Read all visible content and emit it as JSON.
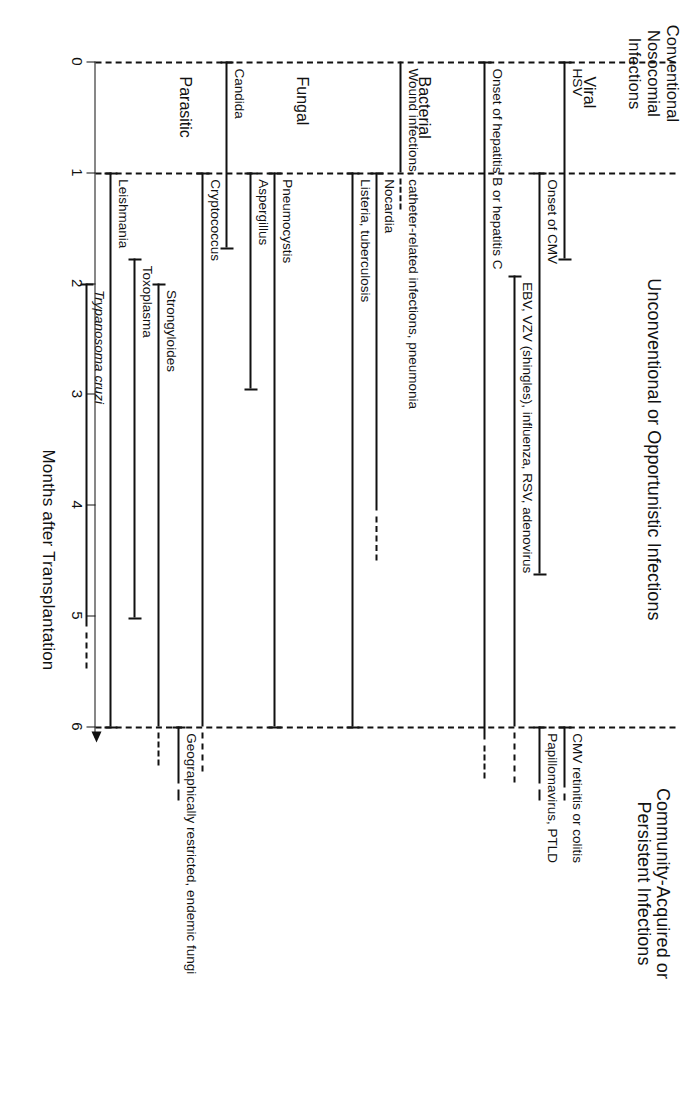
{
  "figure": {
    "axis_title": "Months after Transplantation",
    "x_ticks": [
      "0",
      "1",
      "2",
      "3",
      "4",
      "5",
      "6"
    ],
    "phases": [
      {
        "id": "conventional",
        "lines": [
          "Conventional",
          "Nosocomial",
          "Infections"
        ]
      },
      {
        "id": "unconventional",
        "lines": [
          "Unconventional or Opportunistic Infections"
        ]
      },
      {
        "id": "community",
        "lines": [
          "Community-Acquired or",
          "Persistent Infections"
        ]
      }
    ],
    "groups": [
      {
        "id": "viral",
        "label": "Viral"
      },
      {
        "id": "bacterial",
        "label": "Bacterial"
      },
      {
        "id": "fungal",
        "label": "Fungal"
      },
      {
        "id": "parasitic",
        "label": "Parasitic"
      }
    ]
  },
  "chart_data": {
    "type": "timeline",
    "title": "",
    "xlabel": "Months after Transplantation",
    "ylabel": "",
    "xlim": [
      0,
      6.6
    ],
    "x_ticks": [
      0,
      1,
      2,
      3,
      4,
      5,
      6
    ],
    "grid": false,
    "phase_boundaries": [
      0,
      1,
      6
    ],
    "legend": "",
    "rows": [
      {
        "group": "Viral",
        "label": "HSV",
        "start": 0.0,
        "end": 1.78,
        "dashed_after": null,
        "cap_start": true,
        "cap_end": true
      },
      {
        "group": "Viral",
        "label": "Onset of CMV",
        "start": 1.0,
        "end": 4.62,
        "dashed_after": null,
        "cap_start": true,
        "cap_end": true
      },
      {
        "group": "Viral",
        "label": "EBV, VZV (shingles), influenza, RSV, adenovirus",
        "start": 1.93,
        "end": 6.0,
        "dashed_after": 6.45,
        "cap_start": true,
        "cap_end": false
      },
      {
        "group": "Viral",
        "label": "CMV retinitis or colitis",
        "start": 6.0,
        "end": 6.55,
        "dashed_after": 6.62,
        "cap_start": true,
        "cap_end": false
      },
      {
        "group": "Viral",
        "label": "Papillomavirus, PTLD",
        "start": 6.0,
        "end": 6.52,
        "dashed_after": 6.62,
        "cap_start": true,
        "cap_end": false
      },
      {
        "group": "Viral",
        "label": "Onset of hepatitis B or hepatitis C",
        "start": 0.0,
        "end": 6.12,
        "dashed_after": 6.42,
        "cap_start": true,
        "cap_end": false
      },
      {
        "group": "Bacterial",
        "label": "Wound infections, catheter-related infections, pneumonia",
        "start": 0.0,
        "end": 1.0,
        "dashed_after": 1.28,
        "cap_start": false,
        "cap_end": false
      },
      {
        "group": "Bacterial",
        "label": "Nocardia",
        "start": 1.0,
        "end": 4.05,
        "dashed_after": 4.45,
        "cap_start": true,
        "cap_end": false
      },
      {
        "group": "Bacterial",
        "label": "Listeria, tuberculosis",
        "start": 1.0,
        "end": 6.0,
        "dashed_after": null,
        "cap_start": true,
        "cap_end": true
      },
      {
        "group": "Fungal",
        "label": "Pneumocystis",
        "start": 1.0,
        "end": 6.0,
        "dashed_after": null,
        "cap_start": true,
        "cap_end": true
      },
      {
        "group": "Fungal",
        "label": "Aspergillus",
        "start": 1.0,
        "end": 2.95,
        "dashed_after": null,
        "cap_start": true,
        "cap_end": true
      },
      {
        "group": "Fungal",
        "label": "Candida",
        "start": 0.0,
        "end": 1.68,
        "dashed_after": null,
        "cap_start": true,
        "cap_end": true
      },
      {
        "group": "Fungal",
        "label": "Cryptococcus",
        "start": 1.0,
        "end": 6.0,
        "dashed_after": 6.35,
        "cap_start": true,
        "cap_end": false
      },
      {
        "group": "Fungal",
        "label": "Geographically restricted, endemic fungi",
        "start": 6.0,
        "end": 6.52,
        "dashed_after": 6.62,
        "cap_start": true,
        "cap_end": false
      },
      {
        "group": "Parasitic",
        "label": "Strongyloides",
        "start": 2.0,
        "end": 6.0,
        "dashed_after": 6.3,
        "cap_start": true,
        "cap_end": false
      },
      {
        "group": "Parasitic",
        "label": "Toxoplasma",
        "start": 1.78,
        "end": 5.02,
        "dashed_after": null,
        "cap_start": true,
        "cap_end": true
      },
      {
        "group": "Parasitic",
        "label": "Leishmania",
        "start": 1.0,
        "end": 6.0,
        "dashed_after": null,
        "cap_start": true,
        "cap_end": true
      },
      {
        "group": "Parasitic",
        "label": "Trypanosoma cruzi",
        "italic": true,
        "start": 2.0,
        "end": 5.1,
        "dashed_after": 5.42,
        "cap_start": true,
        "cap_end": false
      }
    ]
  }
}
